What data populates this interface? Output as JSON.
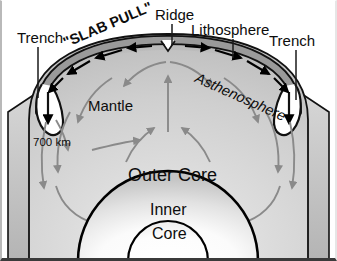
{
  "figure": {
    "background_color": "#ffffff",
    "outline_color": "#000000"
  },
  "labels": {
    "trench_left": "Trench",
    "trench_right": "Trench",
    "ridge": "Ridge",
    "lithosphere": "Lithosphere",
    "asthenosphere": "Asthenosphere",
    "slab_pull": "\"SLAB PULL\"",
    "mantle": "Mantle",
    "depth_700km": "700 km",
    "outer_core": "Outer Core",
    "inner_core_line1": "Inner",
    "inner_core_line2": "Core"
  },
  "layers": [
    {
      "name": "lithosphere",
      "fill": "#9c9c9c",
      "stroke": "#000000"
    },
    {
      "name": "asthenosphere",
      "fill": "#c8c8c8",
      "stroke": "#000000"
    },
    {
      "name": "mantle",
      "fill": "#d2d2d2",
      "stroke": "#000000"
    },
    {
      "name": "outer-core",
      "fill": "#f2f2f2",
      "stroke": "#000000"
    },
    {
      "name": "inner-core",
      "fill": "#ffffff",
      "stroke": "#000000"
    }
  ],
  "arrows": {
    "plate_motion_color": "#000000",
    "convection_color": "#8a8a8a",
    "plate_motion_count": 10,
    "convection_count": 18
  },
  "leader_lines": {
    "color": "#1a1a1a",
    "items": [
      {
        "name": "trench-left-leader",
        "x1": 38,
        "y1": 47,
        "x2": 38,
        "y2": 98
      },
      {
        "name": "trench-right-leader",
        "x1": 296,
        "y1": 50,
        "x2": 296,
        "y2": 100
      },
      {
        "name": "ridge-leader",
        "x1": 172,
        "y1": 24,
        "x2": 172,
        "y2": 45
      },
      {
        "name": "lithosphere-leader",
        "x1": 233,
        "y1": 39,
        "x2": 233,
        "y2": 58
      }
    ]
  }
}
